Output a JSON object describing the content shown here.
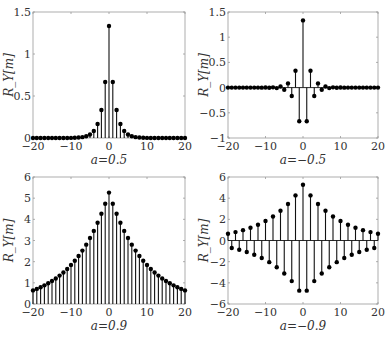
{
  "figure": {
    "layout": "2x2 grid of stem plots",
    "colors": {
      "stem": "#111111",
      "marker": "#000000",
      "axis": "#9a9a9a",
      "text": "#333333",
      "background": "#ffffff"
    }
  },
  "chart_data": [
    {
      "type": "stem",
      "title": "",
      "xlabel": "a=0.5",
      "ylabel": "R_Y[m]",
      "a": 0.5,
      "xlim": [
        -20,
        20
      ],
      "ylim": [
        0,
        1.5
      ],
      "xticks": [
        -20,
        -10,
        0,
        10,
        20
      ],
      "xtick_labels": [
        "−20",
        "−10",
        "0",
        "10",
        "20"
      ],
      "yticks": [
        0,
        0.5,
        1,
        1.5
      ],
      "ytick_labels": [
        "0",
        "0.5",
        "1",
        "1.5"
      ],
      "grid": false,
      "x": [
        -20,
        -19,
        -18,
        -17,
        -16,
        -15,
        -14,
        -13,
        -12,
        -11,
        -10,
        -9,
        -8,
        -7,
        -6,
        -5,
        -4,
        -3,
        -2,
        -1,
        0,
        1,
        2,
        3,
        4,
        5,
        6,
        7,
        8,
        9,
        10,
        11,
        12,
        13,
        14,
        15,
        16,
        17,
        18,
        19,
        20
      ],
      "values": [
        1.3e-06,
        2.5e-06,
        5.1e-06,
        1.02e-05,
        2.03e-05,
        4.07e-05,
        8.14e-05,
        0.000163,
        0.000326,
        0.000651,
        0.0013,
        0.0026,
        0.0052,
        0.0104,
        0.0208,
        0.0417,
        0.0833,
        0.1667,
        0.3333,
        0.6667,
        1.3333,
        0.6667,
        0.3333,
        0.1667,
        0.0833,
        0.0417,
        0.0208,
        0.0104,
        0.0052,
        0.0026,
        0.0013,
        0.000651,
        0.000326,
        0.000163,
        8.14e-05,
        4.07e-05,
        2.03e-05,
        1.02e-05,
        5.1e-06,
        2.5e-06,
        1.3e-06
      ]
    },
    {
      "type": "stem",
      "title": "",
      "xlabel": "a=−0.5",
      "ylabel": "R_Y[m]",
      "a": -0.5,
      "xlim": [
        -20,
        20
      ],
      "ylim": [
        -1,
        1.5
      ],
      "xticks": [
        -20,
        -10,
        0,
        10,
        20
      ],
      "xtick_labels": [
        "−20",
        "−10",
        "0",
        "10",
        "20"
      ],
      "yticks": [
        -1,
        -0.5,
        0,
        0.5,
        1,
        1.5
      ],
      "ytick_labels": [
        "−1",
        "−0.5",
        "0",
        "0.5",
        "1",
        "1.5"
      ],
      "grid": false,
      "x": [
        -20,
        -19,
        -18,
        -17,
        -16,
        -15,
        -14,
        -13,
        -12,
        -11,
        -10,
        -9,
        -8,
        -7,
        -6,
        -5,
        -4,
        -3,
        -2,
        -1,
        0,
        1,
        2,
        3,
        4,
        5,
        6,
        7,
        8,
        9,
        10,
        11,
        12,
        13,
        14,
        15,
        16,
        17,
        18,
        19,
        20
      ],
      "values": [
        1.3e-06,
        -2.5e-06,
        5.1e-06,
        -1.02e-05,
        2.03e-05,
        -4.07e-05,
        8.14e-05,
        -0.000163,
        0.000326,
        -0.000651,
        0.0013,
        -0.0026,
        0.0052,
        -0.0104,
        0.0208,
        -0.0417,
        0.0833,
        -0.1667,
        0.3333,
        -0.6667,
        1.3333,
        -0.6667,
        0.3333,
        -0.1667,
        0.0833,
        -0.0417,
        0.0208,
        -0.0104,
        0.0052,
        -0.0026,
        0.0013,
        -0.000651,
        0.000326,
        -0.000163,
        8.14e-05,
        -4.07e-05,
        2.03e-05,
        -1.02e-05,
        5.1e-06,
        -2.5e-06,
        1.3e-06
      ]
    },
    {
      "type": "stem",
      "title": "",
      "xlabel": "a=0.9",
      "ylabel": "R_Y[m]",
      "a": 0.9,
      "xlim": [
        -20,
        20
      ],
      "ylim": [
        0,
        6
      ],
      "xticks": [
        -20,
        -10,
        0,
        10,
        20
      ],
      "xtick_labels": [
        "−20",
        "−10",
        "0",
        "10",
        "20"
      ],
      "yticks": [
        0,
        1,
        2,
        3,
        4,
        5,
        6
      ],
      "ytick_labels": [
        "0",
        "1",
        "2",
        "3",
        "4",
        "5",
        "6"
      ],
      "grid": false,
      "x": [
        -20,
        -19,
        -18,
        -17,
        -16,
        -15,
        -14,
        -13,
        -12,
        -11,
        -10,
        -9,
        -8,
        -7,
        -6,
        -5,
        -4,
        -3,
        -2,
        -1,
        0,
        1,
        2,
        3,
        4,
        5,
        6,
        7,
        8,
        9,
        10,
        11,
        12,
        13,
        14,
        15,
        16,
        17,
        18,
        19,
        20
      ],
      "values": [
        0.642,
        0.713,
        0.792,
        0.88,
        0.978,
        1.087,
        1.207,
        1.341,
        1.49,
        1.656,
        1.84,
        2.044,
        2.271,
        2.524,
        2.804,
        3.116,
        3.453,
        3.837,
        4.263,
        4.737,
        5.263,
        4.737,
        4.263,
        3.837,
        3.453,
        3.116,
        2.804,
        2.524,
        2.271,
        2.044,
        1.84,
        1.656,
        1.49,
        1.341,
        1.207,
        1.087,
        0.978,
        0.88,
        0.792,
        0.713,
        0.642
      ]
    },
    {
      "type": "stem",
      "title": "",
      "xlabel": "a=−0.9",
      "ylabel": "R_Y[m]",
      "a": -0.9,
      "xlim": [
        -20,
        20
      ],
      "ylim": [
        -6,
        6
      ],
      "xticks": [
        -20,
        -10,
        0,
        10,
        20
      ],
      "xtick_labels": [
        "−20",
        "−10",
        "0",
        "10",
        "20"
      ],
      "yticks": [
        -6,
        -4,
        -2,
        0,
        2,
        4,
        6
      ],
      "ytick_labels": [
        "−6",
        "−4",
        "−2",
        "0",
        "2",
        "4",
        "6"
      ],
      "grid": false,
      "x": [
        -20,
        -19,
        -18,
        -17,
        -16,
        -15,
        -14,
        -13,
        -12,
        -11,
        -10,
        -9,
        -8,
        -7,
        -6,
        -5,
        -4,
        -3,
        -2,
        -1,
        0,
        1,
        2,
        3,
        4,
        5,
        6,
        7,
        8,
        9,
        10,
        11,
        12,
        13,
        14,
        15,
        16,
        17,
        18,
        19,
        20
      ],
      "values": [
        0.642,
        -0.713,
        0.792,
        -0.88,
        0.978,
        -1.087,
        1.207,
        -1.341,
        1.49,
        -1.656,
        1.84,
        -2.044,
        2.271,
        -2.524,
        2.804,
        -3.116,
        3.453,
        -3.837,
        4.263,
        -4.737,
        5.263,
        -4.737,
        4.263,
        -3.837,
        3.453,
        -3.116,
        2.804,
        -2.524,
        2.271,
        -2.044,
        1.84,
        -1.656,
        1.49,
        -1.341,
        1.207,
        -1.087,
        0.978,
        -0.88,
        0.792,
        -0.713,
        0.642
      ]
    }
  ],
  "panels": [
    {
      "box": {
        "left": 33,
        "top": 12,
        "right": 185,
        "bottom": 138
      }
    },
    {
      "box": {
        "left": 228,
        "top": 12,
        "right": 378,
        "bottom": 138
      }
    },
    {
      "box": {
        "left": 33,
        "top": 177,
        "right": 185,
        "bottom": 304
      }
    },
    {
      "box": {
        "left": 228,
        "top": 177,
        "right": 378,
        "bottom": 304
      }
    }
  ]
}
